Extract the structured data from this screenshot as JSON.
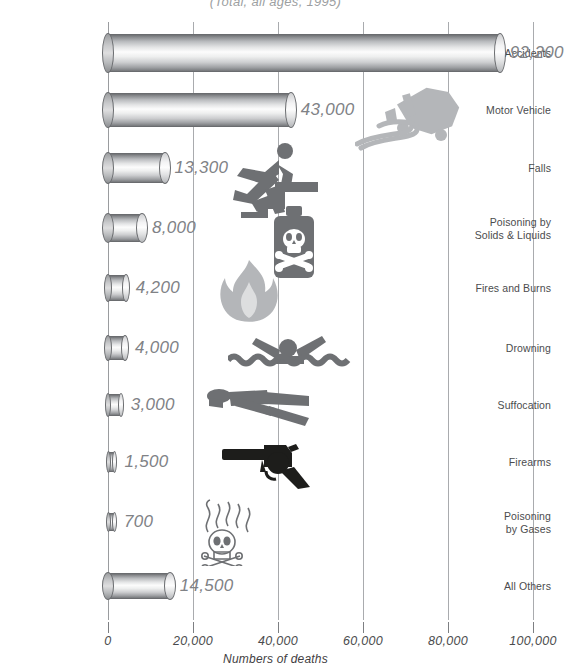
{
  "chart_data": {
    "type": "bar",
    "orientation": "horizontal",
    "title": "",
    "subtitle": "(Total, all ages, 1995)",
    "xlabel": "Numbers of deaths",
    "ylabel": "",
    "xlim": [
      0,
      110000
    ],
    "grid": true,
    "legend": "none",
    "xticks": [
      {
        "value": 0,
        "label": "0"
      },
      {
        "value": 20000,
        "label": "20,000"
      },
      {
        "value": 40000,
        "label": "40,000"
      },
      {
        "value": 60000,
        "label": "60,000"
      },
      {
        "value": 80000,
        "label": "80,000"
      },
      {
        "value": 100000,
        "label": "100,000"
      }
    ],
    "categories": [
      "All Accidents",
      "Motor Vehicle",
      "Falls",
      "Poisoning by Solids & Liquids",
      "Fires and Burns",
      "Drowning",
      "Suffocation",
      "Firearms",
      "Poisoning by Gases",
      "All Others"
    ],
    "values": [
      92200,
      43000,
      13300,
      8000,
      4200,
      4000,
      3000,
      1500,
      700,
      14500
    ],
    "value_labels": [
      "92,200",
      "43,000",
      "13,300",
      "8,000",
      "4,200",
      "4,000",
      "3,000",
      "1,500",
      "700",
      "14,500"
    ]
  },
  "bars": [
    {
      "label": "All Accidents",
      "label_lines": [
        "All Accidents"
      ],
      "value": 92200,
      "value_label": "92,200",
      "icon": "none"
    },
    {
      "label": "Motor Vehicle",
      "label_lines": [
        "Motor Vehicle"
      ],
      "value": 43000,
      "value_label": "43,000",
      "icon": "overturned-car-icon"
    },
    {
      "label": "Falls",
      "label_lines": [
        "Falls"
      ],
      "value": 13300,
      "value_label": "13,300",
      "icon": "person-falling-stairs-icon"
    },
    {
      "label": "Poisoning by Solids & Liquids",
      "label_lines": [
        "Poisoning by",
        "Solids & Liquids"
      ],
      "value": 8000,
      "value_label": "8,000",
      "icon": "poison-bottle-icon"
    },
    {
      "label": "Fires and Burns",
      "label_lines": [
        "Fires and Burns"
      ],
      "value": 4200,
      "value_label": "4,200",
      "icon": "flame-icon"
    },
    {
      "label": "Drowning",
      "label_lines": [
        "Drowning"
      ],
      "value": 4000,
      "value_label": "4,000",
      "icon": "swimmer-drowning-icon"
    },
    {
      "label": "Suffocation",
      "label_lines": [
        "Suffocation"
      ],
      "value": 3000,
      "value_label": "3,000",
      "icon": "person-prone-icon"
    },
    {
      "label": "Firearms",
      "label_lines": [
        "Firearms"
      ],
      "value": 1500,
      "value_label": "1,500",
      "icon": "revolver-icon"
    },
    {
      "label": "Poisoning by Gases",
      "label_lines": [
        "Poisoning",
        "by Gases"
      ],
      "value": 700,
      "value_label": "700",
      "icon": "skull-fumes-icon"
    },
    {
      "label": "All Others",
      "label_lines": [
        "All Others"
      ],
      "value": 14500,
      "value_label": "14,500",
      "icon": "none"
    }
  ],
  "colors": {
    "text": "#4b4c4e",
    "value_text": "#808286",
    "gridline": "#a9abae",
    "icon_gray": "#6e7073",
    "icon_light_gray": "#b4b6b9",
    "icon_dark": "#1d1d1b",
    "background": "#ffffff"
  }
}
